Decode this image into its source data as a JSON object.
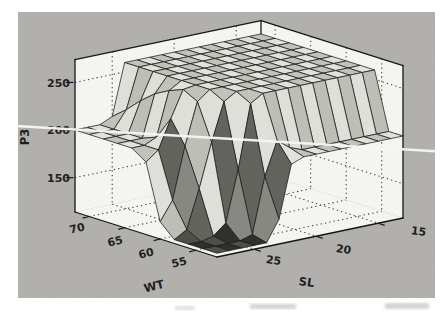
{
  "figure": {
    "panel_bg": "#b5b4b0",
    "wall_color": "#fcfcf9"
  },
  "chart_data": {
    "type": "surface",
    "title": "",
    "xlabel": "WT",
    "ylabel": "SL",
    "zlabel": "P3",
    "x_tick_labels": [
      "70",
      "65",
      "60",
      "55"
    ],
    "y_tick_labels": [
      "25",
      "20",
      "15"
    ],
    "z_tick_labels": [
      "250",
      "200",
      "150"
    ],
    "x_tick_values": [
      70,
      65,
      60,
      55
    ],
    "y_tick_values": [
      25,
      20,
      15
    ],
    "z_tick_values": [
      250,
      200,
      150
    ],
    "x_range": [
      52,
      72
    ],
    "y_range": [
      13,
      28
    ],
    "z_range": [
      114,
      274
    ],
    "legend": "none",
    "grid": "dotted wall and floor grid",
    "levels": {
      "plateau": 260,
      "shelf": 200,
      "pit_floor": 118
    },
    "x_points": [
      52,
      54,
      56,
      58,
      60,
      62,
      64,
      66,
      68,
      70,
      72
    ],
    "y_points": [
      13,
      14,
      15,
      16,
      17,
      18,
      19,
      20,
      21,
      22,
      23,
      24,
      25,
      26,
      27,
      28
    ],
    "z_grid": [
      [
        200,
        200,
        260,
        260,
        260,
        260,
        260,
        260,
        260,
        260,
        260
      ],
      [
        200,
        200,
        260,
        260,
        260,
        260,
        260,
        260,
        260,
        260,
        260
      ],
      [
        200,
        200,
        260,
        260,
        260,
        260,
        260,
        260,
        260,
        260,
        260
      ],
      [
        200,
        200,
        260,
        260,
        260,
        260,
        260,
        260,
        260,
        260,
        260
      ],
      [
        200,
        200,
        260,
        260,
        260,
        260,
        260,
        260,
        260,
        260,
        260
      ],
      [
        200,
        200,
        260,
        260,
        260,
        260,
        260,
        260,
        260,
        260,
        260
      ],
      [
        200,
        200,
        260,
        260,
        260,
        260,
        260,
        260,
        260,
        260,
        260
      ],
      [
        200,
        200,
        260,
        260,
        260,
        260,
        260,
        260,
        260,
        260,
        260
      ],
      [
        200,
        205,
        260,
        260,
        260,
        260,
        260,
        260,
        260,
        260,
        260
      ],
      [
        195,
        215,
        260,
        260,
        260,
        260,
        260,
        260,
        260,
        260,
        260
      ],
      [
        140,
        180,
        252,
        260,
        260,
        260,
        260,
        260,
        260,
        260,
        260
      ],
      [
        118,
        122,
        185,
        252,
        260,
        260,
        260,
        260,
        260,
        260,
        260
      ],
      [
        118,
        118,
        132,
        212,
        250,
        258,
        252,
        244,
        232,
        218,
        206
      ],
      [
        118,
        118,
        121,
        166,
        206,
        230,
        206,
        200,
        200,
        200,
        200
      ],
      [
        118,
        118,
        118,
        126,
        152,
        200,
        200,
        200,
        200,
        200,
        200
      ],
      [
        118,
        118,
        118,
        118,
        132,
        190,
        200,
        200,
        200,
        200,
        200
      ]
    ]
  },
  "colors": {
    "flat_hi_a": "#e9e9e4",
    "flat_hi_b": "#c7c7c0",
    "stripe_a": "#e6e6e1",
    "stripe_b": "#c3c3bc",
    "dark_a": "#63635e",
    "dark_b": "#8a8a84",
    "pit_a": "#2d2d2a",
    "pit_b": "#4e4e49",
    "edge": "#161616",
    "grid_dot": "#3a3a3a",
    "white_streak": "#ffffff"
  }
}
